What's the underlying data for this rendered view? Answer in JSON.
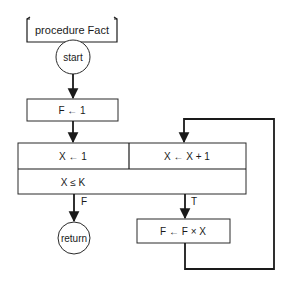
{
  "diagram": {
    "type": "flowchart",
    "procedure_label": "procedure Fact",
    "nodes": {
      "start": "start",
      "init_f": "F ← 1",
      "init_x": "X ← 1",
      "incr_x": "X ← X + 1",
      "condition": "X ≤ K",
      "multiply": "F ← F × X",
      "return": "return"
    },
    "edge_labels": {
      "false": "F",
      "true": "T"
    },
    "colors": {
      "stroke": "#1a1a1a",
      "background": "#ffffff"
    }
  }
}
